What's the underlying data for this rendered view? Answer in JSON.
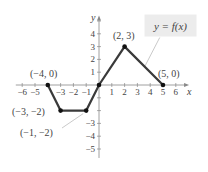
{
  "chart_data": {
    "type": "line",
    "title": "",
    "xlabel": "x",
    "ylabel": "y",
    "function_label": "y = f(x)",
    "xlim": [
      -6.5,
      6.8
    ],
    "ylim": [
      -5.7,
      5.2
    ],
    "x_ticks": [
      -6,
      -5,
      -3,
      -2,
      -1,
      1,
      2,
      3,
      4,
      5,
      6
    ],
    "x_tick_labels": [
      "−6",
      "−5",
      "−3",
      "−2",
      "−1",
      "1",
      "2",
      "3",
      "4",
      "5",
      "6"
    ],
    "y_ticks": [
      4,
      3,
      2,
      1,
      -3,
      -4,
      -5
    ],
    "y_tick_labels": [
      "4",
      "3",
      "2",
      "1",
      "−3",
      "−4",
      "−5"
    ],
    "series": [
      {
        "name": "f(x)",
        "x": [
          -4,
          -3,
          -1,
          0,
          2,
          5
        ],
        "y": [
          0,
          -2,
          -2,
          0,
          3,
          0
        ]
      }
    ],
    "annotations": [
      {
        "text": "(−4, 0)",
        "x": -4,
        "y": 0
      },
      {
        "text": "(−3, −2)",
        "x": -3,
        "y": -2
      },
      {
        "text": "(−1, −2)",
        "x": -1,
        "y": -2
      },
      {
        "text": "(2, 3)",
        "x": 2,
        "y": 3
      },
      {
        "text": "(5, 0)",
        "x": 5,
        "y": 0
      }
    ],
    "grid": false
  },
  "colors": {
    "curve": "#3a3a3a",
    "axis": "#888888",
    "label_box": "#ececec",
    "leader_line": "#bbbbbb"
  }
}
